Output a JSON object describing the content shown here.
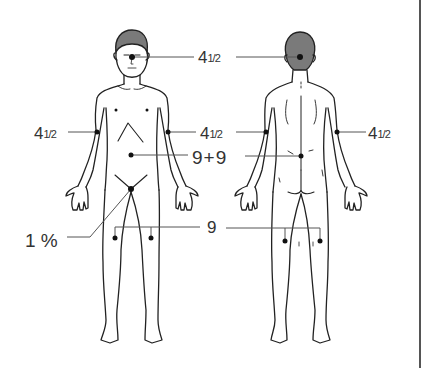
{
  "figure": {
    "views": [
      "front",
      "back"
    ],
    "colors": {
      "stroke": "#222222",
      "hair": "#7a7a7a",
      "leader_line": "#555555",
      "dot": "#111111"
    }
  },
  "labels": {
    "head": {
      "whole": "4",
      "frac": "1/2",
      "text": "4½"
    },
    "front_right_arm": {
      "whole": "4",
      "frac": "1/2",
      "text": "4½"
    },
    "front_left_arm_back_right_arm": {
      "whole": "4",
      "frac": "1/2",
      "text": "4½"
    },
    "back_left_arm": {
      "whole": "4",
      "frac": "1/2",
      "text": "4½"
    },
    "trunk": {
      "text": "9 + 9",
      "a": "9",
      "op": "+",
      "b": "9"
    },
    "genitals": {
      "text": "1 %",
      "num": "1",
      "unit": "%"
    },
    "legs": {
      "text": "9"
    }
  }
}
